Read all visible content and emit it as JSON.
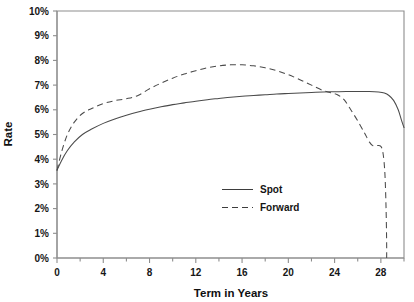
{
  "chart_data": {
    "type": "line",
    "title": "",
    "xlabel": "Term in Years",
    "ylabel": "Rate",
    "xlim": [
      0,
      30
    ],
    "ylim": [
      0,
      10
    ],
    "grid": false,
    "legend_position": "inside-center-right",
    "xticks": [
      0,
      4,
      8,
      12,
      16,
      20,
      24,
      28
    ],
    "xtick_labels": [
      "0",
      "4",
      "8",
      "12",
      "16",
      "20",
      "24",
      "28"
    ],
    "xminor_ticks": [
      2,
      6,
      10,
      14,
      18,
      22,
      26,
      30
    ],
    "yticks": [
      0,
      1,
      2,
      3,
      4,
      5,
      6,
      7,
      8,
      9,
      10
    ],
    "ytick_labels": [
      "0%",
      "1%",
      "2%",
      "3%",
      "4%",
      "5%",
      "6%",
      "7%",
      "8%",
      "9%",
      "10%"
    ],
    "series": [
      {
        "name": "Spot",
        "style": "solid",
        "x": [
          0.0,
          0.4,
          0.9,
          1.5,
          2.2,
          3.0,
          4.0,
          5.0,
          6.0,
          7.0,
          8.0,
          9.0,
          10.0,
          11.0,
          12.0,
          13.0,
          14.0,
          15.0,
          16.0,
          17.0,
          18.0,
          19.0,
          20.0,
          21.0,
          22.0,
          23.0,
          24.0,
          25.0,
          26.0,
          27.0,
          27.8,
          28.3,
          28.7,
          29.1,
          29.5,
          29.8,
          30.0
        ],
        "y": [
          3.55,
          3.95,
          4.35,
          4.7,
          5.0,
          5.22,
          5.45,
          5.63,
          5.78,
          5.91,
          6.02,
          6.12,
          6.21,
          6.28,
          6.35,
          6.41,
          6.46,
          6.51,
          6.55,
          6.58,
          6.61,
          6.64,
          6.66,
          6.68,
          6.7,
          6.72,
          6.73,
          6.74,
          6.74,
          6.74,
          6.72,
          6.68,
          6.58,
          6.38,
          6.0,
          5.55,
          5.28
        ]
      },
      {
        "name": "Forward",
        "style": "dashed",
        "x": [
          0.0,
          0.4,
          0.9,
          1.5,
          2.2,
          3.0,
          4.0,
          5.0,
          6.0,
          7.0,
          8.0,
          9.0,
          10.0,
          11.0,
          12.0,
          13.0,
          14.0,
          15.0,
          16.0,
          17.0,
          18.0,
          19.0,
          20.0,
          21.0,
          22.0,
          23.0,
          23.6,
          24.2,
          24.8,
          25.4,
          26.0,
          26.6,
          27.0,
          27.3,
          27.6,
          28.0,
          28.2,
          28.35,
          28.45,
          28.5,
          28.5
        ],
        "y": [
          3.55,
          4.3,
          5.0,
          5.5,
          5.85,
          6.05,
          6.25,
          6.37,
          6.45,
          6.58,
          6.85,
          7.08,
          7.28,
          7.45,
          7.58,
          7.7,
          7.78,
          7.82,
          7.82,
          7.78,
          7.7,
          7.58,
          7.42,
          7.22,
          7.0,
          6.78,
          6.7,
          6.62,
          6.42,
          6.0,
          5.55,
          5.05,
          4.7,
          4.55,
          4.55,
          4.52,
          4.2,
          3.4,
          2.0,
          0.6,
          0.0
        ]
      }
    ],
    "annotations": [
      {
        "name": "forward-peak",
        "x": 15.5,
        "y": 7.82,
        "text": ""
      },
      {
        "name": "crossover",
        "x": 23.0,
        "y": 6.75,
        "text": ""
      }
    ]
  },
  "legend": {
    "items": [
      {
        "label": "Spot",
        "style": "solid"
      },
      {
        "label": "Forward",
        "style": "dashed"
      }
    ]
  },
  "axes": {
    "y_title": "Rate",
    "x_title": "Term in Years"
  }
}
